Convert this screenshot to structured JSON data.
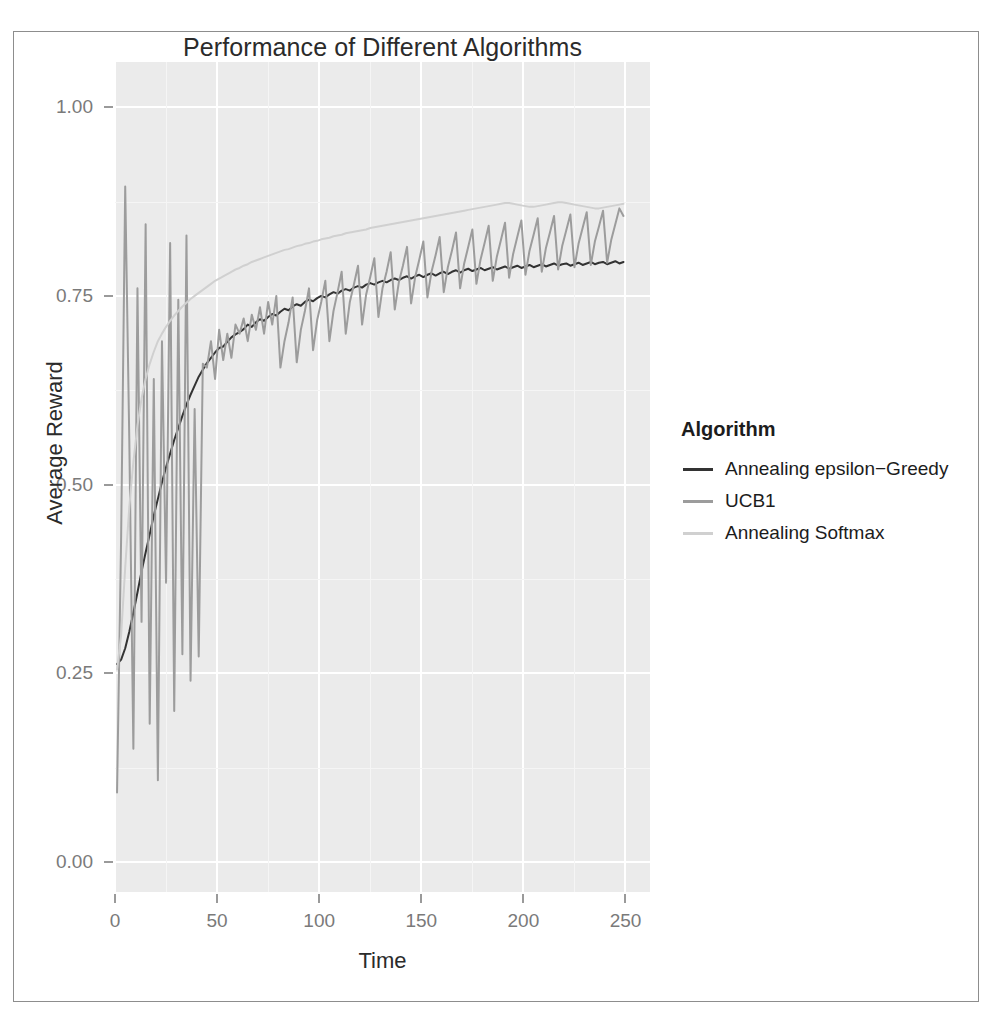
{
  "chart_data": {
    "type": "line",
    "title": "Performance of Different Algorithms",
    "xlabel": "Time",
    "ylabel": "Average Reward",
    "xlim": [
      0,
      262
    ],
    "ylim": [
      -0.04,
      1.06
    ],
    "xticks": [
      0,
      50,
      100,
      150,
      200,
      250
    ],
    "xtick_labels": [
      "0",
      "50",
      "100",
      "150",
      "200",
      "250"
    ],
    "yticks": [
      0.0,
      0.25,
      0.5,
      0.75,
      1.0
    ],
    "ytick_labels": [
      "0.00",
      "0.25",
      "0.50",
      "0.75",
      "1.00"
    ],
    "grid": true,
    "legend_position": "right",
    "legend_title": "Algorithm",
    "panel_background": "#ebebeb",
    "grid_color": "#ffffff",
    "series": [
      {
        "name": "Annealing epsilon-Greedy",
        "display_name": "Annealing epsilon−Greedy",
        "color": "#333333",
        "x": [
          1,
          3,
          5,
          7,
          9,
          11,
          13,
          15,
          17,
          19,
          21,
          23,
          25,
          27,
          29,
          31,
          33,
          35,
          37,
          39,
          41,
          43,
          45,
          47,
          49,
          51,
          53,
          55,
          57,
          59,
          61,
          63,
          65,
          67,
          69,
          71,
          73,
          75,
          77,
          79,
          81,
          83,
          85,
          87,
          89,
          91,
          93,
          95,
          97,
          99,
          101,
          103,
          105,
          107,
          109,
          111,
          113,
          115,
          117,
          119,
          121,
          123,
          125,
          127,
          129,
          131,
          133,
          135,
          137,
          139,
          141,
          143,
          145,
          147,
          149,
          151,
          153,
          155,
          157,
          159,
          161,
          163,
          165,
          167,
          169,
          171,
          173,
          175,
          177,
          179,
          181,
          183,
          185,
          187,
          189,
          191,
          193,
          195,
          197,
          199,
          201,
          203,
          205,
          207,
          209,
          211,
          213,
          215,
          217,
          219,
          221,
          223,
          225,
          227,
          229,
          231,
          233,
          235,
          237,
          239,
          241,
          243,
          245,
          247,
          249
        ],
        "y": [
          0.262,
          0.268,
          0.283,
          0.305,
          0.33,
          0.357,
          0.385,
          0.41,
          0.434,
          0.459,
          0.481,
          0.503,
          0.523,
          0.541,
          0.559,
          0.575,
          0.591,
          0.606,
          0.619,
          0.631,
          0.643,
          0.652,
          0.661,
          0.668,
          0.675,
          0.681,
          0.683,
          0.689,
          0.695,
          0.699,
          0.702,
          0.706,
          0.712,
          0.709,
          0.715,
          0.719,
          0.717,
          0.722,
          0.726,
          0.724,
          0.729,
          0.733,
          0.731,
          0.736,
          0.739,
          0.737,
          0.742,
          0.745,
          0.743,
          0.747,
          0.75,
          0.748,
          0.752,
          0.755,
          0.753,
          0.757,
          0.759,
          0.757,
          0.761,
          0.763,
          0.761,
          0.765,
          0.767,
          0.765,
          0.768,
          0.77,
          0.768,
          0.771,
          0.773,
          0.771,
          0.774,
          0.776,
          0.773,
          0.776,
          0.778,
          0.775,
          0.778,
          0.78,
          0.777,
          0.78,
          0.782,
          0.779,
          0.782,
          0.784,
          0.781,
          0.784,
          0.786,
          0.783,
          0.785,
          0.787,
          0.784,
          0.786,
          0.788,
          0.785,
          0.787,
          0.789,
          0.786,
          0.788,
          0.79,
          0.787,
          0.789,
          0.791,
          0.788,
          0.79,
          0.792,
          0.789,
          0.791,
          0.793,
          0.79,
          0.792,
          0.793,
          0.79,
          0.792,
          0.794,
          0.791,
          0.793,
          0.795,
          0.792,
          0.794,
          0.795,
          0.792,
          0.794,
          0.796,
          0.793,
          0.795
        ]
      },
      {
        "name": "UCB1",
        "display_name": "UCB1",
        "color": "#9c9c9c",
        "x": [
          1,
          3,
          5,
          7,
          9,
          11,
          13,
          15,
          17,
          19,
          21,
          23,
          25,
          27,
          29,
          31,
          33,
          35,
          37,
          39,
          41,
          43,
          45,
          47,
          49,
          51,
          53,
          55,
          57,
          59,
          61,
          63,
          65,
          67,
          69,
          71,
          73,
          75,
          77,
          79,
          81,
          83,
          85,
          87,
          89,
          91,
          93,
          95,
          97,
          99,
          101,
          103,
          105,
          107,
          109,
          111,
          113,
          115,
          117,
          119,
          121,
          123,
          125,
          127,
          129,
          131,
          133,
          135,
          137,
          139,
          141,
          143,
          145,
          147,
          149,
          151,
          153,
          155,
          157,
          159,
          161,
          163,
          165,
          167,
          169,
          171,
          173,
          175,
          177,
          179,
          181,
          183,
          185,
          187,
          189,
          191,
          193,
          195,
          197,
          199,
          201,
          203,
          205,
          207,
          209,
          211,
          213,
          215,
          217,
          219,
          221,
          223,
          225,
          227,
          229,
          231,
          233,
          235,
          237,
          239,
          241,
          243,
          245,
          247,
          249
        ],
        "y": [
          0.092,
          0.43,
          0.895,
          0.56,
          0.15,
          0.76,
          0.318,
          0.845,
          0.183,
          0.64,
          0.108,
          0.69,
          0.37,
          0.82,
          0.2,
          0.745,
          0.275,
          0.83,
          0.24,
          0.6,
          0.272,
          0.66,
          0.655,
          0.69,
          0.64,
          0.705,
          0.665,
          0.7,
          0.668,
          0.712,
          0.7,
          0.72,
          0.69,
          0.725,
          0.705,
          0.735,
          0.7,
          0.742,
          0.712,
          0.75,
          0.655,
          0.69,
          0.715,
          0.748,
          0.662,
          0.705,
          0.73,
          0.76,
          0.678,
          0.718,
          0.742,
          0.77,
          0.69,
          0.73,
          0.755,
          0.782,
          0.7,
          0.742,
          0.765,
          0.79,
          0.712,
          0.752,
          0.775,
          0.8,
          0.722,
          0.76,
          0.782,
          0.808,
          0.732,
          0.768,
          0.79,
          0.815,
          0.74,
          0.775,
          0.798,
          0.822,
          0.748,
          0.782,
          0.804,
          0.828,
          0.755,
          0.788,
          0.81,
          0.834,
          0.76,
          0.793,
          0.815,
          0.838,
          0.766,
          0.798,
          0.82,
          0.843,
          0.77,
          0.802,
          0.824,
          0.847,
          0.774,
          0.806,
          0.828,
          0.85,
          0.778,
          0.81,
          0.831,
          0.853,
          0.782,
          0.813,
          0.834,
          0.856,
          0.785,
          0.816,
          0.837,
          0.858,
          0.788,
          0.819,
          0.84,
          0.861,
          0.791,
          0.822,
          0.842,
          0.863,
          0.794,
          0.824,
          0.845,
          0.866,
          0.856
        ]
      },
      {
        "name": "Annealing Softmax",
        "display_name": "Annealing Softmax",
        "color": "#d0d0d0",
        "x": [
          1,
          3,
          5,
          7,
          9,
          11,
          13,
          15,
          17,
          19,
          21,
          23,
          25,
          27,
          29,
          31,
          33,
          35,
          37,
          39,
          41,
          43,
          45,
          47,
          49,
          51,
          53,
          55,
          57,
          59,
          61,
          63,
          65,
          67,
          69,
          71,
          73,
          75,
          77,
          79,
          81,
          83,
          85,
          87,
          89,
          91,
          93,
          95,
          97,
          99,
          101,
          103,
          105,
          107,
          109,
          111,
          113,
          115,
          117,
          119,
          121,
          123,
          125,
          127,
          129,
          131,
          133,
          135,
          137,
          139,
          141,
          143,
          145,
          147,
          149,
          151,
          153,
          155,
          157,
          159,
          161,
          163,
          165,
          167,
          169,
          171,
          173,
          175,
          177,
          179,
          181,
          183,
          185,
          187,
          189,
          191,
          193,
          195,
          197,
          199,
          201,
          203,
          205,
          207,
          209,
          211,
          213,
          215,
          217,
          219,
          221,
          223,
          225,
          227,
          229,
          231,
          233,
          235,
          237,
          239,
          241,
          243,
          245,
          247,
          249
        ],
        "y": [
          0.255,
          0.3,
          0.39,
          0.47,
          0.53,
          0.578,
          0.614,
          0.64,
          0.66,
          0.676,
          0.69,
          0.7,
          0.709,
          0.717,
          0.724,
          0.73,
          0.736,
          0.741,
          0.746,
          0.75,
          0.754,
          0.758,
          0.762,
          0.766,
          0.77,
          0.773,
          0.776,
          0.779,
          0.782,
          0.785,
          0.787,
          0.79,
          0.792,
          0.795,
          0.797,
          0.799,
          0.801,
          0.803,
          0.805,
          0.807,
          0.809,
          0.811,
          0.812,
          0.814,
          0.816,
          0.817,
          0.819,
          0.82,
          0.822,
          0.823,
          0.825,
          0.826,
          0.827,
          0.829,
          0.83,
          0.831,
          0.833,
          0.834,
          0.835,
          0.836,
          0.837,
          0.838,
          0.84,
          0.841,
          0.842,
          0.843,
          0.844,
          0.845,
          0.846,
          0.847,
          0.848,
          0.849,
          0.85,
          0.851,
          0.852,
          0.853,
          0.854,
          0.855,
          0.856,
          0.857,
          0.858,
          0.859,
          0.86,
          0.861,
          0.862,
          0.863,
          0.864,
          0.865,
          0.866,
          0.867,
          0.868,
          0.869,
          0.87,
          0.871,
          0.872,
          0.873,
          0.873,
          0.872,
          0.871,
          0.87,
          0.869,
          0.868,
          0.868,
          0.869,
          0.87,
          0.871,
          0.872,
          0.873,
          0.874,
          0.874,
          0.873,
          0.872,
          0.871,
          0.87,
          0.869,
          0.868,
          0.867,
          0.866,
          0.866,
          0.867,
          0.868,
          0.869,
          0.87,
          0.871,
          0.872
        ]
      }
    ]
  },
  "legend": {
    "title": "Algorithm",
    "items": [
      {
        "label": "Annealing epsilon−Greedy",
        "color": "#333333"
      },
      {
        "label": "UCB1",
        "color": "#9c9c9c"
      },
      {
        "label": "Annealing Softmax",
        "color": "#d0d0d0"
      }
    ]
  }
}
